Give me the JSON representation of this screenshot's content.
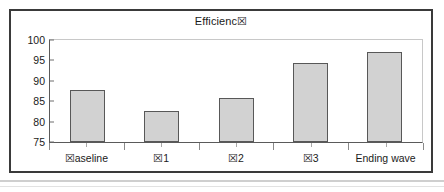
{
  "chart_data": {
    "type": "bar",
    "title": "Efficienc☒",
    "subtitle": "",
    "xlabel": "",
    "ylabel": "",
    "categories": [
      "☒aseline",
      "☒1",
      "☒2",
      "☒3",
      "Ending wave"
    ],
    "values": [
      87.8,
      82.7,
      85.7,
      94.3,
      97.0
    ],
    "ylim": [
      75,
      100
    ],
    "yticks": [
      100,
      95,
      90,
      85,
      80,
      75
    ],
    "ytick_labels": [
      "100",
      "95",
      "90",
      "85",
      "80",
      "75"
    ],
    "grid": false,
    "legend": false,
    "legend_position": "none",
    "series": [
      {
        "name": "Efficiency",
        "values": [
          87.8,
          82.7,
          85.7,
          94.3,
          97.0
        ]
      }
    ]
  },
  "style": {
    "bar_fill": "#d2d2d2",
    "bar_border": "#585858",
    "axis_color": "#5a5a5a",
    "frame_color": "#3a3a3a",
    "plot_background": "#ffffff",
    "text_color": "#1a1a1a"
  }
}
